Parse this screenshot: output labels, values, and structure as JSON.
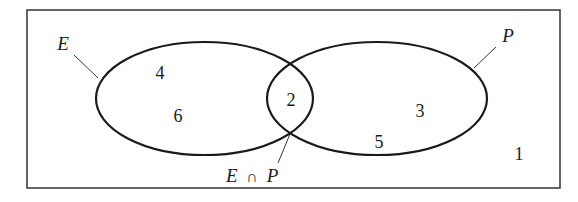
{
  "diagram": {
    "type": "venn",
    "universe": {
      "label": "",
      "outside_value": "1"
    },
    "sets": [
      {
        "name": "E",
        "label": "E",
        "values": [
          "4",
          "6"
        ]
      },
      {
        "name": "P",
        "label": "P",
        "values": [
          "3",
          "5"
        ]
      }
    ],
    "intersection": {
      "label": "E ∩ P",
      "label_left": "E",
      "label_symbol": "∩",
      "label_right": "P",
      "values": [
        "2"
      ]
    }
  },
  "colors": {
    "stroke": "#1a1a1a",
    "background": "#ffffff"
  }
}
